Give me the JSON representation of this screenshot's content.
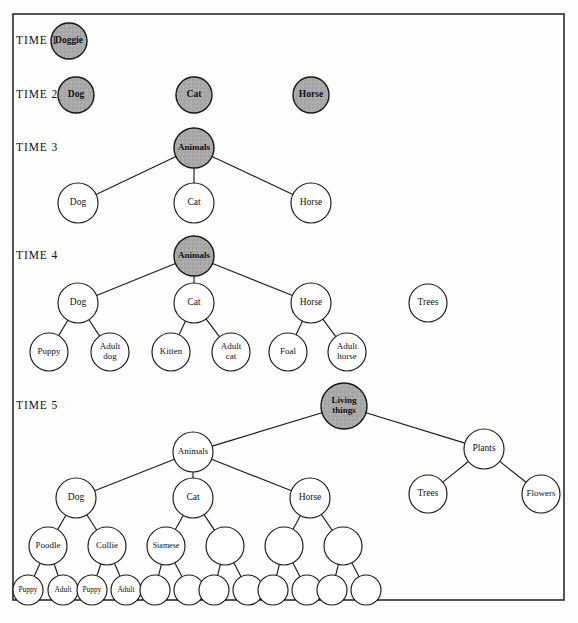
{
  "figure": {
    "background_color": "#fdfdfc",
    "frame_color": "#2b2b2b",
    "shaded_node_color": "#a9a9a9",
    "plain_node_color": "#ffffff",
    "edge_color": "#1c1c1c",
    "text_color": "#111111"
  },
  "time_labels": [
    {
      "id": "time-1",
      "text": "TIME 1",
      "x": 16,
      "y": 41
    },
    {
      "id": "time-2",
      "text": "TIME 2",
      "x": 16,
      "y": 95
    },
    {
      "id": "time-3",
      "text": "TIME 3",
      "x": 16,
      "y": 148
    },
    {
      "id": "time-4",
      "text": "TIME 4",
      "x": 16,
      "y": 256
    },
    {
      "id": "time-5",
      "text": "TIME 5",
      "x": 16,
      "y": 406
    }
  ],
  "nodes": [
    {
      "id": "t1-doggie",
      "label": "Doggie",
      "x": 69,
      "y": 41,
      "r": 18,
      "shaded": true,
      "font": 9.5,
      "lines": [
        "Doggie"
      ]
    },
    {
      "id": "t2-dog",
      "label": "Dog",
      "x": 76,
      "y": 95,
      "r": 18,
      "shaded": true,
      "font": 9.5,
      "lines": [
        "Dog"
      ]
    },
    {
      "id": "t2-cat",
      "label": "Cat",
      "x": 194,
      "y": 95,
      "r": 18,
      "shaded": true,
      "font": 9.5,
      "lines": [
        "Cat"
      ]
    },
    {
      "id": "t2-horse",
      "label": "Horse",
      "x": 311,
      "y": 95,
      "r": 18,
      "shaded": true,
      "font": 9.5,
      "lines": [
        "Horse"
      ]
    },
    {
      "id": "t3-animals",
      "label": "Animals",
      "x": 194,
      "y": 148,
      "r": 20,
      "shaded": true,
      "font": 9,
      "lines": [
        "Animals"
      ]
    },
    {
      "id": "t3-dog",
      "label": "Dog",
      "x": 78,
      "y": 203,
      "r": 20,
      "shaded": false,
      "font": 9.5,
      "lines": [
        "Dog"
      ]
    },
    {
      "id": "t3-cat",
      "label": "Cat",
      "x": 194,
      "y": 203,
      "r": 20,
      "shaded": false,
      "font": 9.5,
      "lines": [
        "Cat"
      ]
    },
    {
      "id": "t3-horse",
      "label": "Horse",
      "x": 311,
      "y": 203,
      "r": 20,
      "shaded": false,
      "font": 9.5,
      "lines": [
        "Horse"
      ]
    },
    {
      "id": "t4-animals",
      "label": "Animals",
      "x": 194,
      "y": 256,
      "r": 20,
      "shaded": true,
      "font": 9,
      "lines": [
        "Animals"
      ]
    },
    {
      "id": "t4-dog",
      "label": "Dog",
      "x": 78,
      "y": 303,
      "r": 20,
      "shaded": false,
      "font": 9.5,
      "lines": [
        "Dog"
      ]
    },
    {
      "id": "t4-cat",
      "label": "Cat",
      "x": 194,
      "y": 303,
      "r": 20,
      "shaded": false,
      "font": 9.5,
      "lines": [
        "Cat"
      ]
    },
    {
      "id": "t4-horse",
      "label": "Horse",
      "x": 311,
      "y": 303,
      "r": 20,
      "shaded": false,
      "font": 9.5,
      "lines": [
        "Horse"
      ]
    },
    {
      "id": "t4-trees",
      "label": "Trees",
      "x": 428,
      "y": 303,
      "r": 19,
      "shaded": false,
      "font": 9.5,
      "lines": [
        "Trees"
      ]
    },
    {
      "id": "t4-puppy",
      "label": "Puppy",
      "x": 49,
      "y": 352,
      "r": 19,
      "shaded": false,
      "font": 9,
      "lines": [
        "Puppy"
      ]
    },
    {
      "id": "t4-adult-dog",
      "label": "Adult dog",
      "x": 110,
      "y": 352,
      "r": 19,
      "shaded": false,
      "font": 9,
      "lines": [
        "Adult",
        "dog"
      ]
    },
    {
      "id": "t4-kitten",
      "label": "Kitten",
      "x": 171,
      "y": 352,
      "r": 19,
      "shaded": false,
      "font": 9,
      "lines": [
        "Kitten"
      ]
    },
    {
      "id": "t4-adult-cat",
      "label": "Adult cat",
      "x": 231,
      "y": 352,
      "r": 19,
      "shaded": false,
      "font": 9,
      "lines": [
        "Adult",
        "cat"
      ]
    },
    {
      "id": "t4-foal",
      "label": "Foal",
      "x": 288,
      "y": 352,
      "r": 19,
      "shaded": false,
      "font": 9,
      "lines": [
        "Foal"
      ]
    },
    {
      "id": "t4-adult-horse",
      "label": "Adult horse",
      "x": 347,
      "y": 352,
      "r": 19,
      "shaded": false,
      "font": 9,
      "lines": [
        "Adult",
        "horse"
      ]
    },
    {
      "id": "t5-living-things",
      "label": "Living things",
      "x": 344,
      "y": 406,
      "r": 23,
      "shaded": true,
      "font": 9,
      "lines": [
        "Living",
        "things"
      ]
    },
    {
      "id": "t5-animals",
      "label": "Animals",
      "x": 193,
      "y": 452,
      "r": 20,
      "shaded": false,
      "font": 9,
      "lines": [
        "Animals"
      ]
    },
    {
      "id": "t5-plants",
      "label": "Plants",
      "x": 484,
      "y": 449,
      "r": 20,
      "shaded": false,
      "font": 9.5,
      "lines": [
        "Plants"
      ]
    },
    {
      "id": "t5-dog",
      "label": "Dog",
      "x": 76,
      "y": 498,
      "r": 20,
      "shaded": false,
      "font": 9.5,
      "lines": [
        "Dog"
      ]
    },
    {
      "id": "t5-cat",
      "label": "Cat",
      "x": 193,
      "y": 498,
      "r": 20,
      "shaded": false,
      "font": 9.5,
      "lines": [
        "Cat"
      ]
    },
    {
      "id": "t5-horse",
      "label": "Horse",
      "x": 310,
      "y": 498,
      "r": 20,
      "shaded": false,
      "font": 9.5,
      "lines": [
        "Horse"
      ]
    },
    {
      "id": "t5-trees",
      "label": "Trees",
      "x": 428,
      "y": 494,
      "r": 19,
      "shaded": false,
      "font": 9.5,
      "lines": [
        "Trees"
      ]
    },
    {
      "id": "t5-flowers",
      "label": "Flowers",
      "x": 541,
      "y": 494,
      "r": 19,
      "shaded": false,
      "font": 9,
      "lines": [
        "Flowers"
      ]
    },
    {
      "id": "t5-poodle",
      "label": "Poodle",
      "x": 48,
      "y": 546,
      "r": 19,
      "shaded": false,
      "font": 9,
      "lines": [
        "Poodle"
      ]
    },
    {
      "id": "t5-collie",
      "label": "Collie",
      "x": 107,
      "y": 546,
      "r": 19,
      "shaded": false,
      "font": 9,
      "lines": [
        "Collie"
      ]
    },
    {
      "id": "t5-siamese",
      "label": "Siamese",
      "x": 166,
      "y": 546,
      "r": 19,
      "shaded": false,
      "font": 8,
      "lines": [
        "Siamese"
      ]
    },
    {
      "id": "t5-cat-breed-2",
      "label": "",
      "x": 225,
      "y": 546,
      "r": 19,
      "shaded": false,
      "font": 9,
      "lines": []
    },
    {
      "id": "t5-horse-breed-1",
      "label": "",
      "x": 284,
      "y": 546,
      "r": 19,
      "shaded": false,
      "font": 9,
      "lines": []
    },
    {
      "id": "t5-horse-breed-2",
      "label": "",
      "x": 343,
      "y": 546,
      "r": 19,
      "shaded": false,
      "font": 9,
      "lines": []
    },
    {
      "id": "t5-poodle-puppy",
      "label": "Puppy",
      "x": 28,
      "y": 590,
      "r": 15,
      "shaded": false,
      "font": 7.5,
      "lines": [
        "Puppy"
      ]
    },
    {
      "id": "t5-poodle-adult",
      "label": "Adult",
      "x": 63,
      "y": 590,
      "r": 15,
      "shaded": false,
      "font": 7.5,
      "lines": [
        "Adult"
      ]
    },
    {
      "id": "t5-collie-puppy",
      "label": "Puppy",
      "x": 92,
      "y": 590,
      "r": 15,
      "shaded": false,
      "font": 7.5,
      "lines": [
        "Puppy"
      ]
    },
    {
      "id": "t5-collie-adult",
      "label": "Adult",
      "x": 126,
      "y": 590,
      "r": 15,
      "shaded": false,
      "font": 7.5,
      "lines": [
        "Adult"
      ]
    },
    {
      "id": "t5-siamese-child-1",
      "label": "",
      "x": 155,
      "y": 590,
      "r": 15,
      "shaded": false,
      "font": 7.5,
      "lines": []
    },
    {
      "id": "t5-siamese-child-2",
      "label": "",
      "x": 189,
      "y": 590,
      "r": 15,
      "shaded": false,
      "font": 7.5,
      "lines": []
    },
    {
      "id": "t5-cat2-child-1",
      "label": "",
      "x": 214,
      "y": 590,
      "r": 15,
      "shaded": false,
      "font": 7.5,
      "lines": []
    },
    {
      "id": "t5-cat2-child-2",
      "label": "",
      "x": 248,
      "y": 590,
      "r": 15,
      "shaded": false,
      "font": 7.5,
      "lines": []
    },
    {
      "id": "t5-horse1-child-1",
      "label": "",
      "x": 273,
      "y": 590,
      "r": 15,
      "shaded": false,
      "font": 7.5,
      "lines": []
    },
    {
      "id": "t5-horse1-child-2",
      "label": "",
      "x": 307,
      "y": 590,
      "r": 15,
      "shaded": false,
      "font": 7.5,
      "lines": []
    },
    {
      "id": "t5-horse2-child-1",
      "label": "",
      "x": 332,
      "y": 590,
      "r": 15,
      "shaded": false,
      "font": 7.5,
      "lines": []
    },
    {
      "id": "t5-horse2-child-2",
      "label": "",
      "x": 366,
      "y": 590,
      "r": 15,
      "shaded": false,
      "font": 7.5,
      "lines": []
    }
  ],
  "edges": [
    {
      "from": "t3-animals",
      "to": "t3-dog"
    },
    {
      "from": "t3-animals",
      "to": "t3-cat"
    },
    {
      "from": "t3-animals",
      "to": "t3-horse"
    },
    {
      "from": "t4-animals",
      "to": "t4-dog"
    },
    {
      "from": "t4-animals",
      "to": "t4-cat"
    },
    {
      "from": "t4-animals",
      "to": "t4-horse"
    },
    {
      "from": "t4-dog",
      "to": "t4-puppy"
    },
    {
      "from": "t4-dog",
      "to": "t4-adult-dog"
    },
    {
      "from": "t4-cat",
      "to": "t4-kitten"
    },
    {
      "from": "t4-cat",
      "to": "t4-adult-cat"
    },
    {
      "from": "t4-horse",
      "to": "t4-foal"
    },
    {
      "from": "t4-horse",
      "to": "t4-adult-horse"
    },
    {
      "from": "t5-living-things",
      "to": "t5-animals"
    },
    {
      "from": "t5-living-things",
      "to": "t5-plants"
    },
    {
      "from": "t5-plants",
      "to": "t5-trees"
    },
    {
      "from": "t5-plants",
      "to": "t5-flowers"
    },
    {
      "from": "t5-animals",
      "to": "t5-dog"
    },
    {
      "from": "t5-animals",
      "to": "t5-cat"
    },
    {
      "from": "t5-animals",
      "to": "t5-horse"
    },
    {
      "from": "t5-dog",
      "to": "t5-poodle"
    },
    {
      "from": "t5-dog",
      "to": "t5-collie"
    },
    {
      "from": "t5-cat",
      "to": "t5-siamese"
    },
    {
      "from": "t5-cat",
      "to": "t5-cat-breed-2"
    },
    {
      "from": "t5-horse",
      "to": "t5-horse-breed-1"
    },
    {
      "from": "t5-horse",
      "to": "t5-horse-breed-2"
    },
    {
      "from": "t5-poodle",
      "to": "t5-poodle-puppy"
    },
    {
      "from": "t5-poodle",
      "to": "t5-poodle-adult"
    },
    {
      "from": "t5-collie",
      "to": "t5-collie-puppy"
    },
    {
      "from": "t5-collie",
      "to": "t5-collie-adult"
    },
    {
      "from": "t5-siamese",
      "to": "t5-siamese-child-1"
    },
    {
      "from": "t5-siamese",
      "to": "t5-siamese-child-2"
    },
    {
      "from": "t5-cat-breed-2",
      "to": "t5-cat2-child-1"
    },
    {
      "from": "t5-cat-breed-2",
      "to": "t5-cat2-child-2"
    },
    {
      "from": "t5-horse-breed-1",
      "to": "t5-horse1-child-1"
    },
    {
      "from": "t5-horse-breed-1",
      "to": "t5-horse1-child-2"
    },
    {
      "from": "t5-horse-breed-2",
      "to": "t5-horse2-child-1"
    },
    {
      "from": "t5-horse-breed-2",
      "to": "t5-horse2-child-2"
    }
  ],
  "frame": {
    "x": 13,
    "y": 14,
    "width": 551,
    "height": 586
  }
}
